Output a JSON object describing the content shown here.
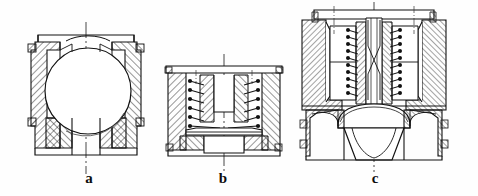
{
  "figure": {
    "kind": "engineering-section-drawing",
    "width": 478,
    "height": 196,
    "background_color": "#fefefe",
    "line_color": "#111111",
    "hatch_color": "#1a1a1a",
    "centerline_color": "#333333",
    "subfigures": [
      {
        "id": "a",
        "caption": "a",
        "caption_x": 89,
        "caption_y": 183,
        "description": "Ball check valve: spherical ball seated inside a hatched sectioned body with upper and lower bores",
        "bbox": {
          "x": 27,
          "y": 30,
          "width": 118,
          "height": 126
        },
        "features": [
          "ball",
          "valve-body",
          "upper-bore",
          "lower-bore",
          "section-hatching",
          "vertical-centerline"
        ]
      },
      {
        "id": "b",
        "caption": "b",
        "caption_x": 223,
        "caption_y": 183,
        "description": "Flat disc valve with helical compression spring inside a sectioned housing",
        "bbox": {
          "x": 164,
          "y": 64,
          "width": 122,
          "height": 92
        },
        "features": [
          "disc-plate",
          "coil-spring",
          "spring-guide-stem",
          "valve-body",
          "section-hatching",
          "vertical-centerline"
        ],
        "spring_coils": 7
      },
      {
        "id": "c",
        "caption": "c",
        "caption_x": 375,
        "caption_y": 183,
        "description": "Double concentric spring-loaded conical poppet valve in a sectioned body with flange",
        "bbox": {
          "x": 298,
          "y": 5,
          "width": 152,
          "height": 155
        },
        "features": [
          "conical-poppet",
          "left-coil-spring",
          "right-coil-spring",
          "central-stem",
          "top-flange",
          "valve-body",
          "section-hatching",
          "vertical-centerline"
        ],
        "spring_coils": 13
      }
    ],
    "captions": [
      "a",
      "b",
      "c"
    ]
  }
}
